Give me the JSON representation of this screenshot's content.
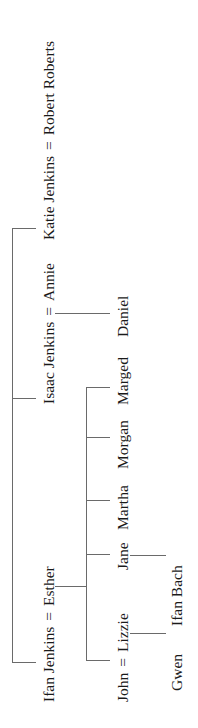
{
  "tree": {
    "generation1": [
      {
        "person": "Ifan Jenkins",
        "spouse": "Esther",
        "separator": "="
      },
      {
        "person": "Isaac Jenkins",
        "spouse": "Annie",
        "separator": "="
      },
      {
        "person": "Katie Jenkins",
        "spouse": "Robert Roberts",
        "separator": "="
      }
    ],
    "generation2": {
      "ifan_esther_children": [
        {
          "person": "John",
          "spouse": "Lizzie",
          "separator": "="
        },
        {
          "person": "Jane"
        },
        {
          "person": "Martha"
        },
        {
          "person": "Morgan"
        },
        {
          "person": "Marged"
        }
      ],
      "isaac_annie_children": [
        {
          "person": "Daniel"
        }
      ]
    },
    "generation3": {
      "john_lizzie_children": [
        {
          "person": "Gwen"
        }
      ],
      "jane_children": [
        {
          "person": "Ifan Bach"
        }
      ]
    }
  },
  "colors": {
    "line": "#6a6a6a",
    "text": "#1a1a1a",
    "background": "#ffffff"
  }
}
